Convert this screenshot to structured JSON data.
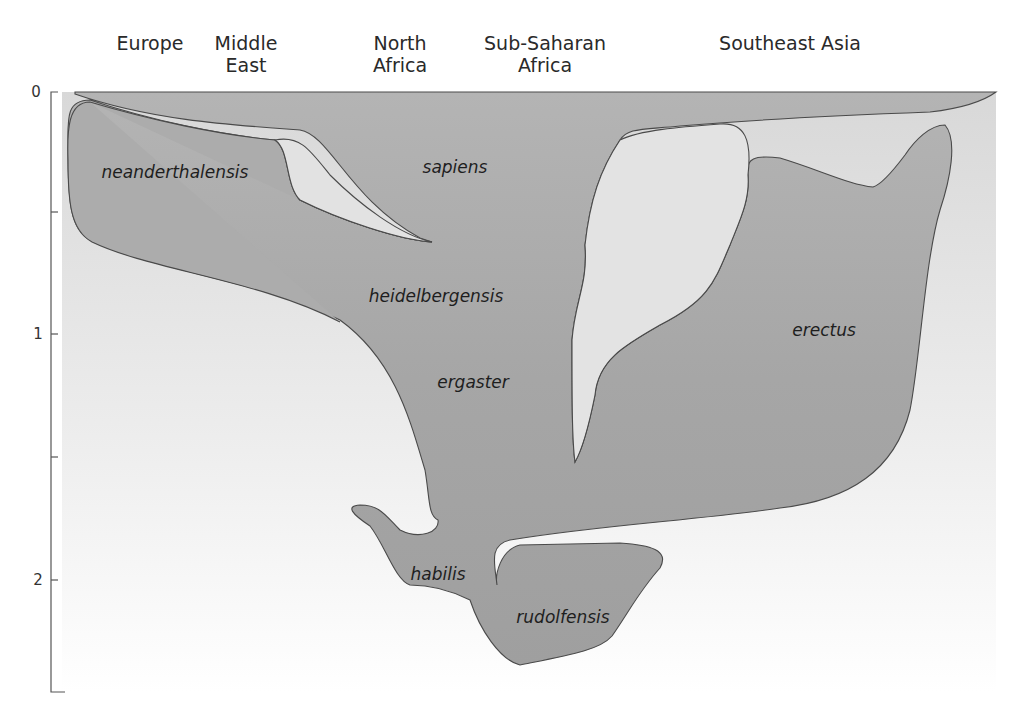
{
  "diagram": {
    "type": "phylogeny-region-time",
    "regions": [
      {
        "label": "Europe",
        "x": 150
      },
      {
        "label": "Middle\nEast",
        "x": 246
      },
      {
        "label": "North\nAfrica",
        "x": 400
      },
      {
        "label": "Sub-Saharan\nAfrica",
        "x": 545
      },
      {
        "label": "Southeast Asia",
        "x": 790
      }
    ],
    "axis": {
      "unit_hint": "million years ago",
      "ticks": [
        {
          "label": "0",
          "value": 0,
          "y": 92
        },
        {
          "label": "",
          "value": 0.5,
          "y": 212
        },
        {
          "label": "1",
          "value": 1,
          "y": 334
        },
        {
          "label": "",
          "value": 1.5,
          "y": 457
        },
        {
          "label": "2",
          "value": 2,
          "y": 580
        },
        {
          "label": "",
          "value": 2.5,
          "y": 692
        }
      ]
    },
    "species": [
      {
        "name": "neanderthalensis",
        "x": 175,
        "y": 178
      },
      {
        "name": "sapiens",
        "x": 455,
        "y": 173
      },
      {
        "name": "heidelbergensis",
        "x": 436,
        "y": 302
      },
      {
        "name": "ergaster",
        "x": 473,
        "y": 388
      },
      {
        "name": "erectus",
        "x": 824,
        "y": 336
      },
      {
        "name": "habilis",
        "x": 438,
        "y": 580
      },
      {
        "name": "rudolfensis",
        "x": 563,
        "y": 623
      }
    ],
    "colors": {
      "fill": "#a9a9a9",
      "background_top": "#dcdcdc",
      "background_bottom": "#ffffff",
      "stroke": "#4a4a4a"
    }
  }
}
